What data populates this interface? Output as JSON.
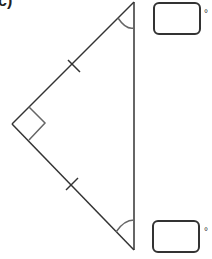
{
  "question_label": "c)",
  "figure": {
    "type": "right isosceles triangle",
    "vertices": {
      "top": [
        134,
        2
      ],
      "left": [
        12,
        124
      ],
      "bottom": [
        134,
        250
      ]
    },
    "right_angle_at": "left",
    "equal_side_ticks": 2,
    "marked_angles": [
      "top",
      "bottom"
    ]
  },
  "answer_boxes": [
    {
      "position": "top",
      "value": "",
      "unit": "°"
    },
    {
      "position": "bottom",
      "value": "",
      "unit": "°"
    }
  ],
  "colors": {
    "stroke": "#333333",
    "background": "#ffffff"
  }
}
